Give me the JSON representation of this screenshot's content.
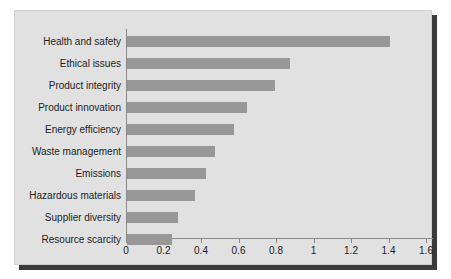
{
  "chart_data": {
    "type": "bar",
    "orientation": "horizontal",
    "title": "",
    "subtitle": "",
    "xlabel": "",
    "ylabel": "",
    "xlim": [
      0,
      1.6
    ],
    "xticks": [
      "0",
      "0.2",
      "0.4",
      "0.6",
      "0.8",
      "1",
      "1.2",
      "1.4",
      "1.6"
    ],
    "xtick_values": [
      0,
      0.2,
      0.4,
      0.6,
      0.8,
      1,
      1.2,
      1.4,
      1.6
    ],
    "grid": false,
    "legend": false,
    "categories": [
      "Health and safety",
      "Ethical issues",
      "Product integrity",
      "Product innovation",
      "Energy efficiency",
      "Waste management",
      "Emissions",
      "Hazardous materials",
      "Supplier diversity",
      "Resource scarcity"
    ],
    "values": [
      1.4,
      0.87,
      0.79,
      0.64,
      0.57,
      0.47,
      0.42,
      0.36,
      0.27,
      0.24
    ],
    "bar_color": "#989898",
    "panel_color": "#e1e1e1",
    "axis_color": "#8a8a8a",
    "text_color": "#1c1c1c"
  }
}
